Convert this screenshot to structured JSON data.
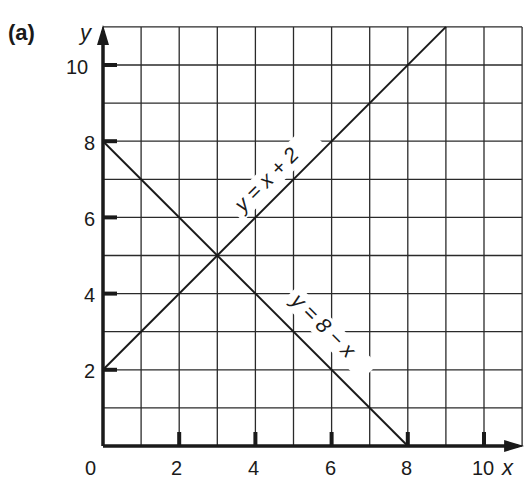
{
  "panel_label": "(a)",
  "axes": {
    "x_label": "x",
    "y_label": "y",
    "x_ticks": [
      "0",
      "2",
      "4",
      "6",
      "8",
      "10"
    ],
    "y_ticks": [
      "2",
      "4",
      "6",
      "8",
      "10"
    ]
  },
  "lines": [
    {
      "label": "y = x + 2",
      "color": "#1a1a1a"
    },
    {
      "label": "y = 8 − x",
      "color": "#1a1a1a"
    }
  ],
  "chart_data": {
    "type": "line",
    "title": "(a)",
    "xlabel": "x",
    "ylabel": "y",
    "xlim": [
      0,
      11
    ],
    "ylim": [
      0,
      11
    ],
    "grid": true,
    "x_ticks": [
      0,
      2,
      4,
      6,
      8,
      10
    ],
    "y_ticks": [
      2,
      4,
      6,
      8,
      10
    ],
    "series": [
      {
        "name": "y = x + 2",
        "x": [
          0,
          9
        ],
        "y": [
          2,
          11
        ]
      },
      {
        "name": "y = 8 − x",
        "x": [
          0,
          8
        ],
        "y": [
          8,
          0
        ]
      }
    ],
    "annotations": [
      {
        "text": "y = x + 2",
        "position": "along line, near (4.5, 7)"
      },
      {
        "text": "y = 8 − x",
        "position": "along line, near (6, 3)"
      },
      {
        "text": "intersection",
        "point": [
          3,
          5
        ]
      }
    ]
  }
}
